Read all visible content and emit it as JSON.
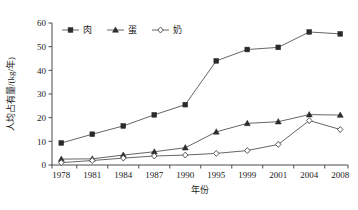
{
  "chart_data": {
    "type": "line",
    "title": "",
    "xlabel": "年份",
    "ylabel": "人均占有量/(kg/年)",
    "categories": [
      "1978",
      "1981",
      "1984",
      "1987",
      "1990",
      "1995",
      "1999",
      "2001",
      "2004",
      "2008"
    ],
    "ylim": [
      0,
      60
    ],
    "yticks": [
      0,
      10,
      20,
      30,
      40,
      50,
      60
    ],
    "grid": false,
    "legend_position": "top-left-inside",
    "series": [
      {
        "name": "肉",
        "marker": "filled-square",
        "values": [
          9.3,
          13.0,
          16.5,
          21.2,
          25.5,
          44.0,
          48.8,
          49.7,
          56.2,
          55.4
        ]
      },
      {
        "name": "蛋",
        "marker": "filled-triangle",
        "values": [
          2.5,
          2.6,
          4.2,
          5.6,
          7.3,
          14.0,
          17.6,
          18.3,
          21.3,
          21.1
        ]
      },
      {
        "name": "奶",
        "marker": "open-diamond",
        "values": [
          1.0,
          1.9,
          2.9,
          3.8,
          4.2,
          4.9,
          6.1,
          8.7,
          18.8,
          15.0
        ]
      }
    ]
  },
  "colors": {
    "axis": "#4a4a4a",
    "line": "#555555",
    "marker_fill": "#2b2b2b",
    "background": "#ffffff"
  }
}
